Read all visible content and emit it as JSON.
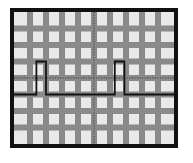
{
  "instrument": {
    "display_name": "oscilloscope-graticule",
    "bezel_color": "#111111",
    "screen_color": "#e9e9e9",
    "grid_color": "#8a8a8a",
    "axis_color": "#555555",
    "trace_color": "#111111"
  },
  "chart_data": {
    "type": "line",
    "title": "",
    "subtitle": "",
    "xlabel": "",
    "ylabel": "",
    "grid": true,
    "legend_position": "none",
    "divisions_x": 10,
    "divisions_y": 8,
    "xlim": [
      -5,
      5
    ],
    "ylim": [
      -4,
      4
    ],
    "xticks": [
      -5,
      -4,
      -3,
      -2,
      -1,
      0,
      1,
      2,
      3,
      4,
      5
    ],
    "yticks": [
      -4,
      -3,
      -2,
      -1,
      0,
      1,
      2,
      3,
      4
    ],
    "xtick_labels": [
      "",
      "",
      "",
      "",
      "",
      "",
      "",
      "",
      "",
      "",
      ""
    ],
    "ytick_labels": [
      "",
      "",
      "",
      "",
      "",
      "",
      "",
      "",
      ""
    ],
    "center_axes": {
      "horizontal_y": 0,
      "vertical_x": 0,
      "style": "dotted",
      "tick_spacing_divisions": 0.2
    },
    "series": [
      {
        "name": "channel-1",
        "style": "square-pulse-train",
        "baseline_y": -1,
        "pulse_top_y": 1,
        "pulse_count": 2,
        "x": [
          -5.0,
          -3.6,
          -3.6,
          -3.0,
          -3.0,
          1.3,
          1.3,
          1.9,
          1.9,
          5.0
        ],
        "y": [
          -1,
          -1,
          1,
          1,
          -1,
          -1,
          1,
          1,
          -1,
          -1
        ],
        "pulses": [
          {
            "index": 1,
            "rise_x": -3.6,
            "fall_x": -3.0,
            "width_divisions": 0.6,
            "amplitude_divisions": 2
          },
          {
            "index": 2,
            "rise_x": 1.3,
            "fall_x": 1.9,
            "width_divisions": 0.6,
            "amplitude_divisions": 2
          }
        ]
      }
    ]
  }
}
